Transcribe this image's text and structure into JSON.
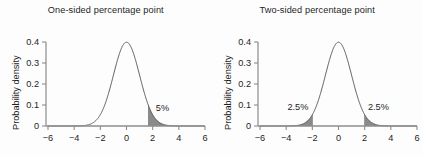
{
  "figure": {
    "background_color": "#fdfdfd",
    "axis_color": "#8c8c8c",
    "curve_color": "#4a4a4a",
    "shade_color": "#8a8a8a",
    "text_color": "#1d1d1d"
  },
  "panels": [
    {
      "id": "one-sided",
      "title": "One-sided percentage point",
      "ylabel": "Probability density",
      "annotations": [
        {
          "label": "5%",
          "x": 2.75,
          "y": 0.072
        }
      ]
    },
    {
      "id": "two-sided",
      "title": "Two-sided percentage point",
      "ylabel": "Probability density",
      "annotations": [
        {
          "label": "2.5%",
          "x": -3.1,
          "y": 0.075
        },
        {
          "label": "2.5%",
          "x": 3.05,
          "y": 0.075
        }
      ]
    }
  ],
  "chart_data": [
    {
      "type": "line",
      "id": "one-sided",
      "title": "One-sided percentage point",
      "xlabel": "",
      "ylabel": "Probability density",
      "xlim": [
        -6,
        6
      ],
      "ylim": [
        0,
        0.4
      ],
      "xticks": [
        -6,
        -4,
        -2,
        0,
        2,
        4,
        6
      ],
      "xticklabels": [
        "−6",
        "−4",
        "−2",
        "0",
        "2",
        "4",
        "6"
      ],
      "yticks": [
        0,
        0.1,
        0.2,
        0.3,
        0.4
      ],
      "yticklabels": [
        "0",
        "0.1",
        "0.2",
        "0.3",
        "0.4"
      ],
      "grid": false,
      "legend": false,
      "distribution": "standard normal (mean 0, sd 1)",
      "series": [
        {
          "name": "Standard normal density",
          "x": [
            -6,
            -5.5,
            -5,
            -4.5,
            -4,
            -3.5,
            -3,
            -2.5,
            -2,
            -1.5,
            -1,
            -0.5,
            0,
            0.5,
            1,
            1.5,
            2,
            2.5,
            3,
            3.5,
            4,
            4.5,
            5,
            5.5,
            6
          ],
          "y": [
            0.0,
            0.0,
            1.5e-06,
            1.6e-05,
            0.0001338,
            0.0008727,
            0.0044318,
            0.0175283,
            0.053991,
            0.1295176,
            0.2419707,
            0.3520653,
            0.3989423,
            0.3520653,
            0.2419707,
            0.1295176,
            0.053991,
            0.0175283,
            0.0044318,
            0.0008727,
            0.0001338,
            1.6e-05,
            1.5e-06,
            0.0,
            0.0
          ]
        }
      ],
      "shaded_regions": [
        {
          "from": 1.645,
          "to": 6,
          "area": 0.05,
          "label": "5%"
        }
      ],
      "annotations": [
        {
          "text": "5%",
          "x": 2.75,
          "y": 0.072
        }
      ]
    },
    {
      "type": "line",
      "id": "two-sided",
      "title": "Two-sided percentage point",
      "xlabel": "",
      "ylabel": "Probability density",
      "xlim": [
        -6,
        6
      ],
      "ylim": [
        0,
        0.4
      ],
      "xticks": [
        -6,
        -4,
        -2,
        0,
        2,
        4,
        6
      ],
      "xticklabels": [
        "−6",
        "−4",
        "−2",
        "0",
        "2",
        "4",
        "6"
      ],
      "yticks": [
        0,
        0.1,
        0.2,
        0.3,
        0.4
      ],
      "yticklabels": [
        "0",
        "0.1",
        "0.2",
        "0.3",
        "0.4"
      ],
      "grid": false,
      "legend": false,
      "distribution": "standard normal (mean 0, sd 1)",
      "series": [
        {
          "name": "Standard normal density",
          "x": [
            -6,
            -5.5,
            -5,
            -4.5,
            -4,
            -3.5,
            -3,
            -2.5,
            -2,
            -1.5,
            -1,
            -0.5,
            0,
            0.5,
            1,
            1.5,
            2,
            2.5,
            3,
            3.5,
            4,
            4.5,
            5,
            5.5,
            6
          ],
          "y": [
            0.0,
            0.0,
            1.5e-06,
            1.6e-05,
            0.0001338,
            0.0008727,
            0.0044318,
            0.0175283,
            0.053991,
            0.1295176,
            0.2419707,
            0.3520653,
            0.3989423,
            0.3520653,
            0.2419707,
            0.1295176,
            0.053991,
            0.0175283,
            0.0044318,
            0.0008727,
            0.0001338,
            1.6e-05,
            1.5e-06,
            0.0,
            0.0
          ]
        }
      ],
      "shaded_regions": [
        {
          "from": -6,
          "to": -1.96,
          "area": 0.025,
          "label": "2.5%"
        },
        {
          "from": 1.96,
          "to": 6,
          "area": 0.025,
          "label": "2.5%"
        }
      ],
      "annotations": [
        {
          "text": "2.5%",
          "x": -3.1,
          "y": 0.075
        },
        {
          "text": "2.5%",
          "x": 3.05,
          "y": 0.075
        }
      ]
    }
  ]
}
